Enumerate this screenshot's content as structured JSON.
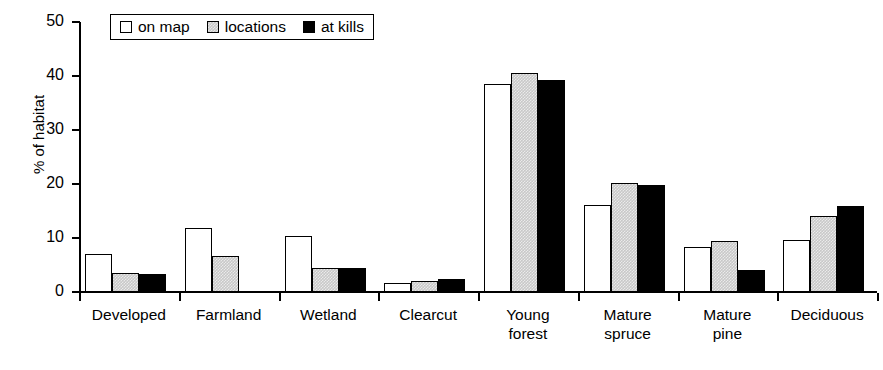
{
  "chart_data": {
    "type": "bar",
    "title": "",
    "xlabel": "",
    "ylabel": "% of habitat",
    "ylim": [
      0,
      50
    ],
    "ytick_step": 10,
    "yticks": [
      0,
      10,
      20,
      30,
      40,
      50
    ],
    "grid": false,
    "legend_position": "top-left",
    "categories": [
      "Developed",
      "Farmland",
      "Wetland",
      "Clearcut",
      "Young forest",
      "Mature spruce",
      "Mature pine",
      "Deciduous"
    ],
    "category_lines": [
      [
        "Developed"
      ],
      [
        "Farmland"
      ],
      [
        "Wetland"
      ],
      [
        "Clearcut"
      ],
      [
        "Young",
        "forest"
      ],
      [
        "Mature",
        "spruce"
      ],
      [
        "Mature",
        "pine"
      ],
      [
        "Deciduous"
      ]
    ],
    "series": [
      {
        "name": "on map",
        "fill": "white",
        "color": "#ffffff",
        "values": [
          7.0,
          11.8,
          10.3,
          1.7,
          38.6,
          16.2,
          8.3,
          9.7
        ]
      },
      {
        "name": "locations",
        "fill": "gray-hatch",
        "color": "#c8c8c8",
        "values": [
          3.5,
          6.7,
          4.5,
          2.0,
          40.5,
          20.2,
          9.4,
          14.0
        ]
      },
      {
        "name": "at kills",
        "fill": "black",
        "color": "#000000",
        "values": [
          3.4,
          0.0,
          4.5,
          2.5,
          39.2,
          19.8,
          4.1,
          16.0
        ]
      }
    ]
  },
  "legend": {
    "items": [
      {
        "label": "on map"
      },
      {
        "label": "locations"
      },
      {
        "label": "at kills"
      }
    ]
  }
}
